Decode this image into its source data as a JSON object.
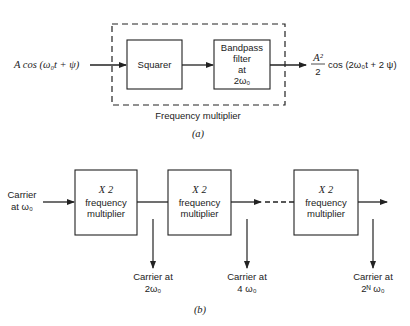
{
  "figure_a": {
    "input_signal": "A cos (ω₀t + ψ)",
    "block_1": "Squarer",
    "block_2": [
      "Bandpass",
      "filter",
      "at",
      "2ω₀"
    ],
    "output_numerator": "A²",
    "output_denominator": "2",
    "output_signal": "cos (2ω₀t + 2 ψ)",
    "group_label": "Frequency multiplier",
    "caption": "(a)"
  },
  "figure_b": {
    "input_label": [
      "Carrier",
      "at ω₀"
    ],
    "blocks": [
      {
        "line1": "X 2",
        "line2": "frequency",
        "line3": "multiplier"
      },
      {
        "line1": "X 2",
        "line2": "frequency",
        "line3": "multiplier"
      },
      {
        "line1": "X 2",
        "line2": "frequency",
        "line3": "multiplier"
      }
    ],
    "taps": [
      {
        "line1": "Carrier at",
        "line2": "2ω₀"
      },
      {
        "line1": "Carrier at",
        "line2": "4 ω₀"
      },
      {
        "line1": "Carrier at",
        "line2": "2ᴺ ω₀"
      }
    ],
    "caption": "(b)"
  },
  "colors": {
    "stroke": "#222222",
    "background": "#ffffff"
  }
}
